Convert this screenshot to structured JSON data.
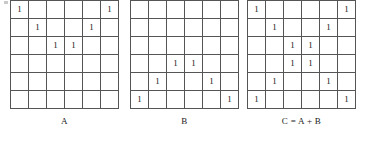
{
  "figure": {
    "caption_separator": "=",
    "matrices": [
      {
        "id": "A",
        "caption": "A",
        "rows": 6,
        "cols": 6,
        "cells": [
          [
            "1",
            "",
            "",
            "",
            "",
            "1"
          ],
          [
            "",
            "1",
            "",
            "",
            "1",
            ""
          ],
          [
            "",
            "",
            "1",
            "1",
            "",
            ""
          ],
          [
            "",
            "",
            "",
            "",
            "",
            ""
          ],
          [
            "",
            "",
            "",
            "",
            "",
            ""
          ],
          [
            "",
            "",
            "",
            "",
            "",
            ""
          ]
        ]
      },
      {
        "id": "B",
        "caption": "B",
        "rows": 6,
        "cols": 6,
        "cells": [
          [
            "",
            "",
            "",
            "",
            "",
            ""
          ],
          [
            "",
            "",
            "",
            "",
            "",
            ""
          ],
          [
            "",
            "",
            "",
            "",
            "",
            ""
          ],
          [
            "",
            "",
            "1",
            "1",
            "",
            ""
          ],
          [
            "",
            "1",
            "",
            "",
            "1",
            ""
          ],
          [
            "1",
            "",
            "",
            "",
            "",
            "1"
          ]
        ]
      },
      {
        "id": "C",
        "caption": "C = A + B",
        "rows": 6,
        "cols": 6,
        "cells": [
          [
            "1",
            "",
            "",
            "",
            "",
            "1"
          ],
          [
            "",
            "1",
            "",
            "",
            "1",
            ""
          ],
          [
            "",
            "",
            "1",
            "1",
            "",
            ""
          ],
          [
            "",
            "",
            "1",
            "1",
            "",
            ""
          ],
          [
            "",
            "1",
            "",
            "",
            "1",
            ""
          ],
          [
            "1",
            "",
            "",
            "",
            "",
            "1"
          ]
        ]
      }
    ],
    "colors": {
      "grid_line": "#555555",
      "grid_border": "#4a4a4a",
      "digit": "#1a1a1a",
      "background": "#ffffff",
      "artifact": "#c9c9c9"
    }
  }
}
